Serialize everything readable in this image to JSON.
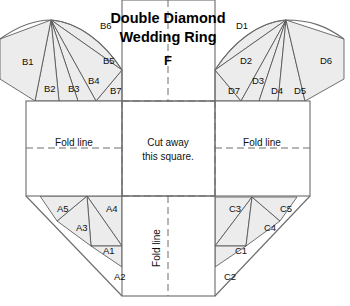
{
  "title": {
    "line1": "Double Diamond",
    "line2": "Wedding Ring",
    "center_panel_label": "F"
  },
  "instructions": {
    "cut_line1": "Cut away",
    "cut_line2": "this square.",
    "fold_left": "Fold line",
    "fold_right": "Fold line",
    "fold_bottom": "Fold line"
  },
  "colors": {
    "wedge_fill": "#ececec",
    "wedge_stroke": "#4d4d4d",
    "panel_stroke": "#6b6b6b",
    "fold_stroke": "#6f6f6f",
    "background": "#ffffff",
    "text": "#111111"
  },
  "pieces": {
    "top_left_fan": [
      {
        "id": "B1",
        "x": 22,
        "y": 62
      },
      {
        "id": "B2",
        "x": 44,
        "y": 89
      },
      {
        "id": "B3",
        "x": 68,
        "y": 89
      },
      {
        "id": "B4",
        "x": 88,
        "y": 81
      },
      {
        "id": "B5",
        "x": 103,
        "y": 61
      },
      {
        "id": "B6",
        "x": 100,
        "y": 26
      },
      {
        "id": "B7",
        "x": 110,
        "y": 91
      }
    ],
    "top_right_fan": [
      {
        "id": "D1",
        "x": 236,
        "y": 26
      },
      {
        "id": "D2",
        "x": 240,
        "y": 61
      },
      {
        "id": "D3",
        "x": 252,
        "y": 81
      },
      {
        "id": "D4",
        "x": 271,
        "y": 91
      },
      {
        "id": "D5",
        "x": 294,
        "y": 91
      },
      {
        "id": "D6",
        "x": 320,
        "y": 61
      },
      {
        "id": "D7",
        "x": 228,
        "y": 91
      }
    ],
    "bottom_left_fan": [
      {
        "id": "A1",
        "x": 103,
        "y": 251
      },
      {
        "id": "A2",
        "x": 114,
        "y": 277
      },
      {
        "id": "A3",
        "x": 76,
        "y": 228
      },
      {
        "id": "A4",
        "x": 106,
        "y": 209
      },
      {
        "id": "A5",
        "x": 57,
        "y": 209
      }
    ],
    "bottom_right_fan": [
      {
        "id": "C1",
        "x": 235,
        "y": 251
      },
      {
        "id": "C2",
        "x": 224,
        "y": 277
      },
      {
        "id": "C3",
        "x": 229,
        "y": 209
      },
      {
        "id": "C4",
        "x": 264,
        "y": 228
      },
      {
        "id": "C5",
        "x": 280,
        "y": 209
      }
    ]
  },
  "chart_data": {
    "type": "diagram",
    "title": "Double Diamond Wedding Ring",
    "labels": [
      "B1",
      "B2",
      "B3",
      "B4",
      "B5",
      "B6",
      "B7",
      "D1",
      "D2",
      "D3",
      "D4",
      "D5",
      "D6",
      "D7",
      "A1",
      "A2",
      "A3",
      "A4",
      "A5",
      "C1",
      "C2",
      "C3",
      "C4",
      "C5",
      "F"
    ],
    "annotations": [
      "Cut away this square.",
      "Fold line",
      "Fold line",
      "Fold line"
    ]
  }
}
